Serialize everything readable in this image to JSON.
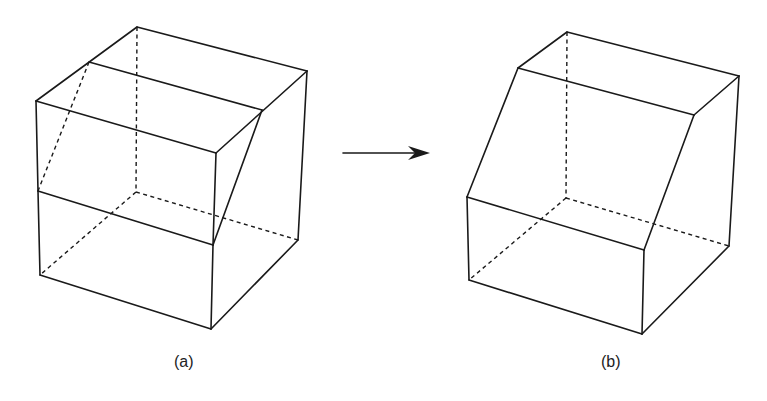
{
  "figures": [
    {
      "id": "a",
      "label": "(a)",
      "description": "Cube with a sloped wedge cut from the upper front-left region",
      "label_pos": {
        "x": 174,
        "y": 353
      },
      "solid_edges": [
        [
          [
            137,
            27
          ],
          [
            307,
            71
          ]
        ],
        [
          [
            137,
            27
          ],
          [
            36,
            101
          ]
        ],
        [
          [
            307,
            71
          ],
          [
            298,
            240
          ]
        ],
        [
          [
            36,
            101
          ],
          [
            216,
            153
          ]
        ],
        [
          [
            89,
            62
          ],
          [
            262,
            110
          ]
        ],
        [
          [
            307,
            71
          ],
          [
            216,
            153
          ]
        ],
        [
          [
            262,
            110
          ],
          [
            213,
            245
          ]
        ],
        [
          [
            216,
            153
          ],
          [
            213,
            245
          ]
        ],
        [
          [
            36,
            101
          ],
          [
            38,
            191
          ]
        ],
        [
          [
            38,
            191
          ],
          [
            213,
            245
          ]
        ],
        [
          [
            38,
            191
          ],
          [
            40,
            275
          ]
        ],
        [
          [
            40,
            275
          ],
          [
            211,
            329
          ]
        ],
        [
          [
            213,
            245
          ],
          [
            211,
            329
          ]
        ],
        [
          [
            211,
            329
          ],
          [
            298,
            240
          ]
        ]
      ],
      "hidden_edges": [
        [
          [
            137,
            27
          ],
          [
            136,
            192
          ]
        ],
        [
          [
            136,
            192
          ],
          [
            40,
            275
          ]
        ],
        [
          [
            136,
            192
          ],
          [
            298,
            240
          ]
        ],
        [
          [
            89,
            62
          ],
          [
            38,
            191
          ]
        ]
      ]
    },
    {
      "id": "b",
      "label": "(b)",
      "description": "Resulting solid with sloped front face after wedge removal",
      "label_pos": {
        "x": 601,
        "y": 353
      },
      "solid_edges": [
        [
          [
            567,
            32
          ],
          [
            739,
            76
          ]
        ],
        [
          [
            567,
            32
          ],
          [
            518,
            68
          ]
        ],
        [
          [
            518,
            68
          ],
          [
            694,
            115
          ]
        ],
        [
          [
            739,
            76
          ],
          [
            694,
            115
          ]
        ],
        [
          [
            739,
            76
          ],
          [
            729,
            246
          ]
        ],
        [
          [
            518,
            68
          ],
          [
            467,
            197
          ]
        ],
        [
          [
            694,
            115
          ],
          [
            644,
            250
          ]
        ],
        [
          [
            467,
            197
          ],
          [
            644,
            250
          ]
        ],
        [
          [
            467,
            197
          ],
          [
            469,
            280
          ]
        ],
        [
          [
            469,
            280
          ],
          [
            642,
            334
          ]
        ],
        [
          [
            644,
            250
          ],
          [
            642,
            334
          ]
        ],
        [
          [
            642,
            334
          ],
          [
            729,
            246
          ]
        ]
      ],
      "hidden_edges": [
        [
          [
            567,
            32
          ],
          [
            566,
            198
          ]
        ],
        [
          [
            566,
            198
          ],
          [
            469,
            280
          ]
        ],
        [
          [
            566,
            198
          ],
          [
            729,
            246
          ]
        ]
      ]
    }
  ],
  "arrow": {
    "from": [
      343,
      153
    ],
    "to": [
      430,
      153
    ],
    "direction": "right",
    "meaning": "transforms into"
  },
  "colors": {
    "line": "#1a1a1a",
    "background": "#ffffff"
  }
}
